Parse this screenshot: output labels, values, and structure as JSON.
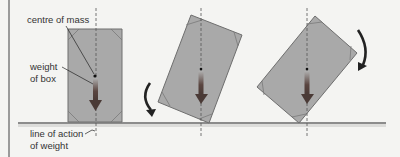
{
  "labels": {
    "centre_of_mass": "centre of mass",
    "weight_line1": "weight",
    "weight_line2": "of box",
    "loa_line1": "line of action",
    "loa_line2": "of weight"
  },
  "colors": {
    "background": "#f4f4f2",
    "box_fill": "#a9a9a9",
    "box_stroke": "#6e6e6e",
    "ground": "#8c8c8c",
    "arrow_top": "#b0b0b0",
    "arrow_bottom": "#4a3a36",
    "rotation_arrow": "#222222",
    "text": "#333333"
  },
  "boxes": [
    {
      "name": "upright",
      "points": "68,29 122,29 122,122 68,122",
      "line_x": 96
    },
    {
      "name": "tilted-left",
      "points": "191,15 242,35 209,123 158,102",
      "line_x": 201
    },
    {
      "name": "tilted-right",
      "points": "315,16 357,53 299,123 257,87",
      "line_x": 307
    }
  ]
}
